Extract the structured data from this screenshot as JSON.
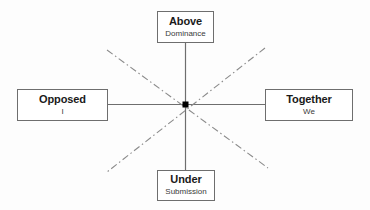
{
  "diagram": {
    "background_color": "#fdfdfd",
    "axis_color": "#6e6e6e",
    "diagonal_color": "#8a8a8a",
    "box_border_color": "#6e6e6e",
    "center_dot_color": "#000000",
    "nodes": [
      {
        "id": "above",
        "position": "top",
        "primary": "Above",
        "secondary": "Dominance"
      },
      {
        "id": "opposed",
        "position": "left",
        "primary": "Opposed",
        "secondary": "I"
      },
      {
        "id": "together",
        "position": "right",
        "primary": "Together",
        "secondary": "We"
      },
      {
        "id": "under",
        "position": "bottom",
        "primary": "Under",
        "secondary": "Submission"
      }
    ],
    "connectors": {
      "vertical_label": "vertical-axis",
      "horizontal_label": "horizontal-axis",
      "diagonal_nwse_label": "diagonal-nw-se",
      "diagonal_nesw_label": "diagonal-ne-sw"
    }
  }
}
